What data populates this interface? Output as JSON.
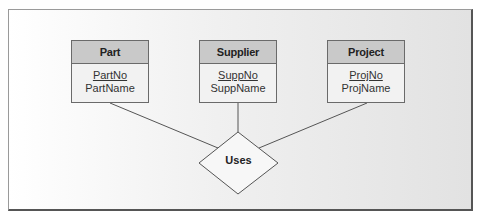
{
  "diagram": {
    "type": "ER diagram",
    "entities": [
      {
        "name": "Part",
        "primary_key": "PartNo",
        "attributes": [
          "PartName"
        ]
      },
      {
        "name": "Supplier",
        "primary_key": "SuppNo",
        "attributes": [
          "SuppName"
        ]
      },
      {
        "name": "Project",
        "primary_key": "ProjNo",
        "attributes": [
          "ProjName"
        ]
      }
    ],
    "relationship": {
      "name": "Uses",
      "connects": [
        "Part",
        "Supplier",
        "Project"
      ]
    }
  },
  "colors": {
    "header_fill": "#c9c9c9",
    "body_fill": "#f2f2f2",
    "border": "#6a6a6a",
    "line": "#555555"
  }
}
